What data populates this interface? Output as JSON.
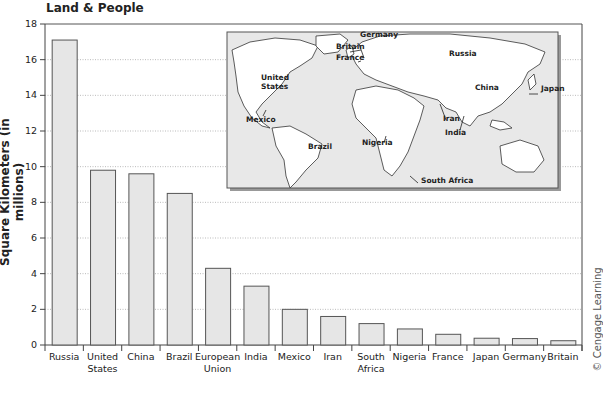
{
  "header": {
    "title": "Land & People",
    "partial_title": "...graphy..."
  },
  "copyright": "© Cengage Learning",
  "map": {
    "labels": [
      {
        "text": "Germany",
        "x": 360,
        "y": 37
      },
      {
        "text": "Britain",
        "x": 336,
        "y": 49
      },
      {
        "text": "France",
        "x": 336,
        "y": 60
      },
      {
        "text": "United",
        "x": 261,
        "y": 80
      },
      {
        "text": "States",
        "x": 261,
        "y": 89
      },
      {
        "text": "Mexico",
        "x": 246,
        "y": 122
      },
      {
        "text": "Brazil",
        "x": 308,
        "y": 149
      },
      {
        "text": "Nigeria",
        "x": 362,
        "y": 145
      },
      {
        "text": "Russia",
        "x": 449,
        "y": 56
      },
      {
        "text": "China",
        "x": 475,
        "y": 90
      },
      {
        "text": "Japan",
        "x": 541,
        "y": 91
      },
      {
        "text": "Iran",
        "x": 443,
        "y": 121
      },
      {
        "text": "India",
        "x": 445,
        "y": 135
      },
      {
        "text": "South Africa",
        "x": 421,
        "y": 183
      }
    ]
  },
  "chart_data": {
    "type": "bar",
    "title": "Land & People",
    "xlabel": "",
    "ylabel": "Square Kilometers (in millions)",
    "ylim": [
      0,
      18
    ],
    "yticks": [
      0,
      2,
      4,
      6,
      8,
      10,
      12,
      14,
      16,
      18
    ],
    "grid": "horizontal dotted",
    "categories": [
      "Russia",
      "United States",
      "China",
      "Brazil",
      "European Union",
      "India",
      "Mexico",
      "Iran",
      "South Africa",
      "Nigeria",
      "France",
      "Japan",
      "Germany",
      "Britain"
    ],
    "category_lines": [
      [
        "Russia"
      ],
      [
        "United",
        "States"
      ],
      [
        "China"
      ],
      [
        "Brazil"
      ],
      [
        "European",
        "Union"
      ],
      [
        "India"
      ],
      [
        "Mexico"
      ],
      [
        "Iran"
      ],
      [
        "South",
        "Africa"
      ],
      [
        "Nigeria"
      ],
      [
        "France"
      ],
      [
        "Japan"
      ],
      [
        "Germany"
      ],
      [
        "Britain"
      ]
    ],
    "values": [
      17.1,
      9.8,
      9.6,
      8.5,
      4.3,
      3.3,
      2.0,
      1.6,
      1.2,
      0.9,
      0.6,
      0.38,
      0.36,
      0.24
    ],
    "bar_color": "#e6e6e6",
    "bar_stroke": "#555555"
  }
}
